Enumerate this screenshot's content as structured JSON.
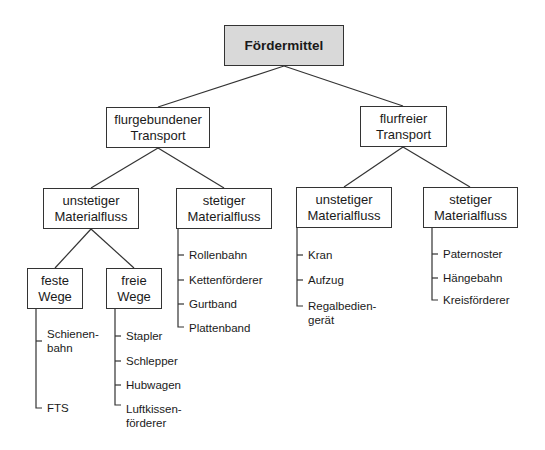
{
  "diagram": {
    "root": {
      "label": "Fördermittel"
    },
    "level1": [
      {
        "label": "flurgebundener\nTransport"
      },
      {
        "label": "flurfreier\nTransport"
      }
    ],
    "level2": [
      {
        "label": "unstetiger\nMaterialfluss"
      },
      {
        "label": "stetiger\nMaterialfluss"
      },
      {
        "label": "unstetiger\nMaterialfluss"
      },
      {
        "label": "stetiger\nMaterialfluss"
      }
    ],
    "level3": [
      {
        "label": "feste\nWege"
      },
      {
        "label": "freie\nWege"
      }
    ],
    "lists": {
      "feste_wege": [
        "Schienen-\nbahn",
        "FTS"
      ],
      "freie_wege": [
        "Stapler",
        "Schlepper",
        "Hubwagen",
        "Luftkissen-\nförderer"
      ],
      "flurgebunden_stetig": [
        "Rollenbahn",
        "Kettenförderer",
        "Gurtband",
        "Plattenband"
      ],
      "flurfrei_unstetig": [
        "Kran",
        "Aufzug",
        "Regalbedien-\ngerät"
      ],
      "flurfrei_stetig": [
        "Paternoster",
        "Hängebahn",
        "Kreisförderer"
      ]
    },
    "colors": {
      "root_fill": "#d9d9d9",
      "line": "#333333"
    }
  }
}
